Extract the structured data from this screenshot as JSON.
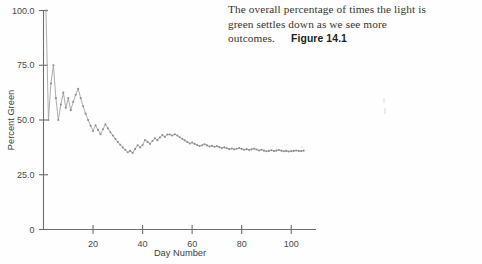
{
  "caption": {
    "text": "The overall percentage of times the light is green settles down as we see more outcomes.",
    "figure_label": "Figure 14.1"
  },
  "chart_data": {
    "type": "line",
    "title": "",
    "xlabel": "Day Number",
    "ylabel": "Percent Green",
    "xlim": [
      0,
      110
    ],
    "ylim": [
      0,
      100
    ],
    "xticks": [
      20,
      40,
      60,
      80,
      100
    ],
    "xtick_labels": [
      "20",
      "40",
      "60",
      "80",
      "100"
    ],
    "yticks": [
      0,
      25,
      50,
      75,
      100
    ],
    "ytick_labels": [
      "0",
      "25.0",
      "50.0",
      "75.0",
      "100.0"
    ],
    "grid": false,
    "legend": "none",
    "marker": "dot",
    "line_color": "#a8a8a8",
    "marker_color": "#8f8f8f",
    "x": [
      1,
      2,
      3,
      4,
      5,
      6,
      7,
      8,
      9,
      10,
      11,
      12,
      13,
      14,
      15,
      16,
      17,
      18,
      19,
      20,
      21,
      22,
      23,
      24,
      25,
      26,
      27,
      28,
      29,
      30,
      31,
      32,
      33,
      34,
      35,
      36,
      37,
      38,
      39,
      40,
      41,
      42,
      43,
      44,
      45,
      46,
      47,
      48,
      49,
      50,
      51,
      52,
      53,
      54,
      55,
      56,
      57,
      58,
      59,
      60,
      61,
      62,
      63,
      64,
      65,
      66,
      67,
      68,
      69,
      70,
      71,
      72,
      73,
      74,
      75,
      76,
      77,
      78,
      79,
      80,
      81,
      82,
      83,
      84,
      85,
      86,
      87,
      88,
      89,
      90,
      91,
      92,
      93,
      94,
      95,
      96,
      97,
      98,
      99,
      100,
      101,
      102,
      103,
      104,
      105
    ],
    "values": [
      100.0,
      50.0,
      66.7,
      75.0,
      60.0,
      50.0,
      57.1,
      62.5,
      55.6,
      60.0,
      54.5,
      58.3,
      61.5,
      64.3,
      60.0,
      56.3,
      52.9,
      50.0,
      47.4,
      45.0,
      47.6,
      45.5,
      43.5,
      45.8,
      48.0,
      46.2,
      44.4,
      42.9,
      41.4,
      40.0,
      38.7,
      37.5,
      36.4,
      35.3,
      35.9,
      35.0,
      36.8,
      38.5,
      37.5,
      38.6,
      40.9,
      40.0,
      39.1,
      40.4,
      41.7,
      40.8,
      42.0,
      43.1,
      42.3,
      43.4,
      43.4,
      42.9,
      43.5,
      42.9,
      42.1,
      41.4,
      40.7,
      40.0,
      39.3,
      39.7,
      39.1,
      38.6,
      38.1,
      38.5,
      38.9,
      38.4,
      37.9,
      38.2,
      37.8,
      38.1,
      37.6,
      37.2,
      37.5,
      37.1,
      36.7,
      37.0,
      36.6,
      36.9,
      37.2,
      36.8,
      36.4,
      36.7,
      36.3,
      36.6,
      36.9,
      36.5,
      36.1,
      36.4,
      36.0,
      35.7,
      35.9,
      36.2,
      35.8,
      36.0,
      36.3,
      36.0,
      35.7,
      35.9,
      35.6,
      35.8,
      35.9,
      36.1,
      35.9,
      35.8,
      36.0
    ]
  }
}
